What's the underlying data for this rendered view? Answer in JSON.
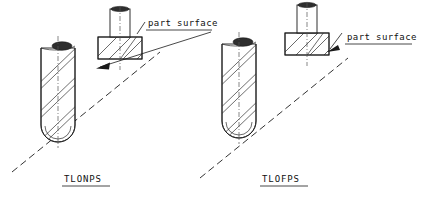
{
  "figure": {
    "background_color": "#ffffff",
    "line_color": "#1a1a1a",
    "dash_color": "#333333"
  },
  "panels": [
    {
      "id": "tlonps",
      "caption": "TLONPS",
      "caption_meaning": "Tool Location ON Part Surface",
      "annotation_label": "part surface",
      "tool_isometric": {
        "name": "ball-nose-end-mill-isometric",
        "flute_count": 3
      },
      "tool_section": {
        "name": "end-mill-section-view",
        "hatched": true
      }
    },
    {
      "id": "tlofps",
      "caption": "TLOFPS",
      "caption_meaning": "Tool Location OFF Part Surface",
      "annotation_label": "part surface",
      "tool_isometric": {
        "name": "ball-nose-end-mill-isometric",
        "flute_count": 3
      },
      "tool_section": {
        "name": "end-mill-section-view",
        "hatched": true
      }
    }
  ],
  "icons": {
    "arrow": "leader-arrow-icon",
    "dashed_line": "part-surface-line-icon",
    "centerline": "tool-axis-centerline-icon"
  }
}
